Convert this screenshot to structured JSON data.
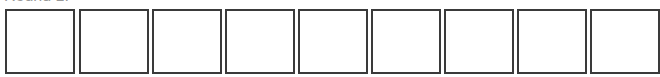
{
  "round": {
    "label": "Round 1:"
  },
  "boxes": [
    {
      "index": 1,
      "value": ""
    },
    {
      "index": 2,
      "value": ""
    },
    {
      "index": 3,
      "value": ""
    },
    {
      "index": 4,
      "value": ""
    },
    {
      "index": 5,
      "value": ""
    },
    {
      "index": 6,
      "value": ""
    },
    {
      "index": 7,
      "value": ""
    },
    {
      "index": 8,
      "value": ""
    },
    {
      "index": 9,
      "value": ""
    }
  ],
  "colors": {
    "border": "#3a3a3a",
    "label": "#9a9a9a",
    "background": "#ffffff"
  }
}
